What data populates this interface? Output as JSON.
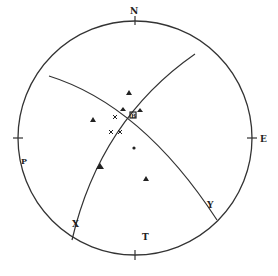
{
  "diagram": {
    "type": "stereonet",
    "primitive_circle": {
      "cx": 135,
      "cy": 138,
      "r": 117
    },
    "directions": {
      "north": "N",
      "east": "E",
      "west_label": "P",
      "south_tick": true
    },
    "great_circles": [
      {
        "id": "plane-1",
        "path": "M49,76 Q142,105 217,220"
      },
      {
        "id": "plane-2",
        "path": "M195,54 Q100,120 72,240"
      }
    ],
    "labels": {
      "intersection": "B",
      "x_label": "X",
      "y_label": "Y",
      "t_label": "T",
      "p_label": "P"
    },
    "points": {
      "triangles": [
        [
          129,
          93
        ],
        [
          93,
          120
        ],
        [
          100,
          167
        ],
        [
          146,
          179
        ],
        [
          122,
          109
        ],
        [
          141,
          110
        ]
      ],
      "crosses": [
        [
          115,
          117
        ],
        [
          111,
          132
        ],
        [
          120,
          132
        ]
      ],
      "dots": [
        [
          134,
          148
        ]
      ]
    },
    "colors": {
      "line": "#333333",
      "background": "#ffffff"
    }
  }
}
